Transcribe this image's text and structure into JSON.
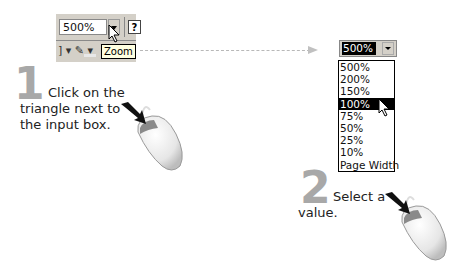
{
  "step1": {
    "number": "1",
    "text_lines": [
      "Click on the",
      "triangle next to",
      "the input box."
    ],
    "toolbar": {
      "zoom_value": "500%",
      "help_label": "?",
      "row2_glyphs": "] ▾ ✎ ▾",
      "tooltip": "Zoom"
    }
  },
  "step2": {
    "number": "2",
    "text_lines": [
      "Select a",
      "value."
    ],
    "zoom_combo": {
      "current_value": "500%",
      "options": [
        "500%",
        "200%",
        "150%",
        "100%",
        "75%",
        "50%",
        "25%",
        "10%",
        "Page Width"
      ],
      "highlighted_option": "100%"
    }
  },
  "colors": {
    "step_number": "#a8a8a8",
    "toolbar_bg": "#d4d0c8",
    "selection_bg": "#000000",
    "tooltip_bg": "#ffffe1"
  },
  "icons": [
    "dropdown-triangle-icon",
    "help-icon",
    "pencil-icon",
    "mouse-pointer-icon",
    "mouse-device-icon",
    "dashed-arrow-icon"
  ]
}
